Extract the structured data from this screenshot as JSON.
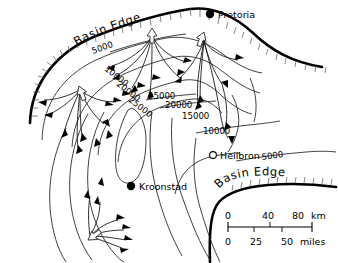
{
  "figure": {
    "type": "isopach-contour-map"
  },
  "basin_edges": [
    {
      "id": "northern",
      "label": "Basin Edge"
    },
    {
      "id": "southern",
      "label": "Basin Edge"
    }
  ],
  "cities": [
    {
      "name": "Pretoria",
      "marker": "filled-circle",
      "x": 210,
      "y": 17
    },
    {
      "name": "Kroonstad",
      "marker": "filled-circle",
      "x": 131,
      "y": 186
    },
    {
      "name": "Heilbron",
      "marker": "open-circle",
      "x": 213,
      "y": 158
    }
  ],
  "contours": [
    {
      "value": "5000",
      "x": 93,
      "y": 54,
      "rotate": -20
    },
    {
      "value": "10000",
      "x": 108,
      "y": 72,
      "rotate": 38
    },
    {
      "value": "20000",
      "x": 120,
      "y": 88,
      "rotate": 38
    },
    {
      "value": "25000",
      "x": 131,
      "y": 104,
      "rotate": 38
    },
    {
      "value": "25000",
      "x": 162,
      "y": 95,
      "rotate": 0
    },
    {
      "value": "20000",
      "x": 180,
      "y": 104,
      "rotate": 0
    },
    {
      "value": "15000",
      "x": 196,
      "y": 115,
      "rotate": 0
    },
    {
      "value": "10000",
      "x": 215,
      "y": 130,
      "rotate": 0
    },
    {
      "value": "5000",
      "x": 272,
      "y": 157,
      "rotate": -8
    }
  ],
  "scale_bar": {
    "top_unit": "km",
    "top_ticks": [
      "0",
      "40",
      "80"
    ],
    "bottom_unit": "miles",
    "bottom_ticks": [
      "0",
      "25",
      "50"
    ]
  },
  "colors": {
    "line": "#2b2b2b",
    "basin": "#000000",
    "background": "#ffffff"
  }
}
